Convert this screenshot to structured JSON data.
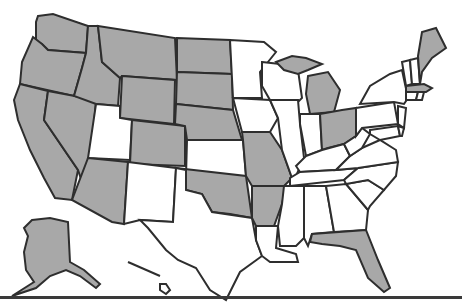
{
  "map": {
    "title": "United States map with highlighted states",
    "colors": {
      "highlighted": "#a8a8a8",
      "not_highlighted": "#ffffff",
      "border": "#2e2e2e",
      "rule": "#3a3a3a"
    },
    "highlighted_states": [
      "WA",
      "OR",
      "CA",
      "NV",
      "ID",
      "MT",
      "WY",
      "CO",
      "AZ",
      "ND",
      "SD",
      "NE",
      "OK",
      "MO",
      "AR",
      "MI",
      "OH",
      "ME",
      "MA",
      "FL",
      "AK"
    ],
    "non_highlighted_states": [
      "UT",
      "NM",
      "TX",
      "KS",
      "MN",
      "IA",
      "WI",
      "IL",
      "IN",
      "KY",
      "TN",
      "MS",
      "AL",
      "GA",
      "SC",
      "NC",
      "VA",
      "WV",
      "PA",
      "NY",
      "VT",
      "NH",
      "CT",
      "RI",
      "NJ",
      "DE",
      "MD",
      "LA",
      "HI"
    ]
  }
}
